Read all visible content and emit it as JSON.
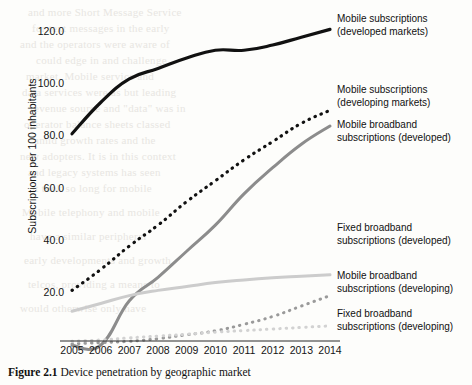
{
  "caption": {
    "number": "Figure 2.1",
    "text": "Device penetration by geographic market"
  },
  "chart_data": {
    "type": "line",
    "title": "",
    "xlabel": "",
    "ylabel": "Subscriptions per 100 inhabitants",
    "categories": [
      "2005",
      "2006",
      "2007",
      "2008",
      "2009",
      "2010",
      "2011",
      "2012",
      "2013",
      "2014"
    ],
    "yticks": [
      "20.0",
      "40.0",
      "60.0",
      "80.0",
      "100.0",
      "120.0"
    ],
    "ylim": [
      0,
      130
    ],
    "grid": false,
    "legend_position": "right",
    "series": [
      {
        "name": "Mobile subscriptions\n(developed markets)",
        "style": "solid",
        "color": "#111111",
        "width": 3.2,
        "values": [
          81,
          93,
          102,
          106,
          110,
          113,
          113,
          115,
          118,
          121
        ]
      },
      {
        "name": "Mobile subscriptions\n(developing markets)",
        "style": "dotted",
        "color": "#111111",
        "width": 3.2,
        "values": [
          21,
          29,
          38,
          46,
          55,
          63,
          71,
          78,
          85,
          90
        ]
      },
      {
        "name": "Mobile broadband\nsubscriptions (developed)",
        "style": "solid",
        "color": "#8c8c8c",
        "width": 3.0,
        "values": [
          0,
          0,
          17,
          26,
          36,
          46,
          58,
          68,
          77,
          84
        ]
      },
      {
        "name": "Fixed broadband\nsubscriptions (developed)",
        "style": "solid",
        "color": "#cccccc",
        "width": 3.0,
        "values": [
          13,
          16,
          19,
          21,
          22.5,
          24,
          25,
          25.8,
          26.4,
          27
        ]
      },
      {
        "name": "Mobile broadband\nsubscriptions (developing)",
        "style": "dotted",
        "color": "#9a9a9a",
        "width": 3.0,
        "values": [
          0.5,
          1,
          1.5,
          2.5,
          4,
          5.5,
          8,
          11,
          15,
          19
        ]
      },
      {
        "name": "Fixed broadband\nsubscriptions (developing)",
        "style": "dotted",
        "color": "#d2d2d2",
        "width": 3.0,
        "values": [
          1.5,
          2,
          2.8,
          3.5,
          4.2,
          5,
          5.6,
          6.2,
          6.8,
          7.4
        ]
      }
    ]
  },
  "legend": [
    {
      "label": "Mobile subscriptions\n(developed markets)"
    },
    {
      "label": "Mobile subscriptions\n(developing markets)"
    },
    {
      "label": "Mobile broadband\nsubscriptions (developed)"
    },
    {
      "label": "Fixed broadband\nsubscriptions (developed)"
    },
    {
      "label": "Mobile broadband\nsubscriptions (developing)"
    },
    {
      "label": "Fixed broadband\nsubscriptions (developing)"
    }
  ],
  "background_text": [
    "and more      Short Message Service",
    "for text messages in the early",
    "and the operators were aware of",
    "could      edge in and      challenge",
    "market.      Mobile      service      and",
    "data services were as but leading",
    "revenue source and \"data\" was in",
    "operator      balance    sheets classed",
    "amid     growth rates and the",
    "new adopters. It is in this context",
    "and legacy      systems      has      seen",
    "it took so     long      for      mobile",
    "Mobile telephony      and      mobile",
    "have a    similar    peripheral",
    "early    developments    and    growth",
    "telcos,     providing    a     means    to",
    "would      otherwise    only      have"
  ]
}
